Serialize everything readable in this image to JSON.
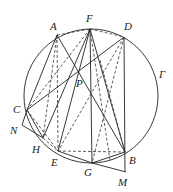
{
  "diagram": {
    "type": "geometry",
    "circle": {
      "label": "Γ",
      "cx": 91,
      "cy": 96,
      "r": 67
    },
    "points": {
      "A": {
        "label": "A",
        "x": 57,
        "y": 35
      },
      "F": {
        "label": "F",
        "x": 90,
        "y": 29
      },
      "D": {
        "label": "D",
        "x": 124,
        "y": 37
      },
      "P": {
        "label": "P",
        "x": 78,
        "y": 72
      },
      "C": {
        "label": "C",
        "x": 27,
        "y": 110
      },
      "N": {
        "label": "N",
        "x": 22,
        "y": 125
      },
      "H": {
        "label": "H",
        "x": 43,
        "y": 138
      },
      "E": {
        "label": "E",
        "x": 58,
        "y": 151
      },
      "G": {
        "label": "G",
        "x": 92,
        "y": 163
      },
      "B": {
        "label": "B",
        "x": 125,
        "y": 152
      },
      "M": {
        "label": "M",
        "x": 126,
        "y": 172
      }
    }
  }
}
